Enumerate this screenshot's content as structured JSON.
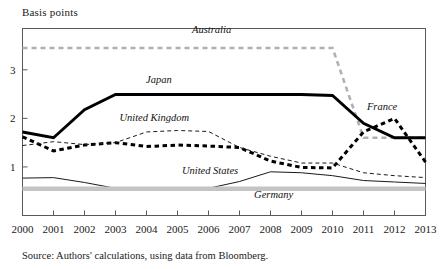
{
  "axis_title": "Basis points",
  "source_note": "Source: Authors' calculations, using data from Bloomberg.",
  "chart_data": {
    "type": "line",
    "title": "Basis points",
    "xlabel": "",
    "ylabel": "Basis points",
    "grid": false,
    "legend_position": "inline-labels",
    "xlim": [
      2000,
      2013
    ],
    "ylim": [
      0,
      3.85
    ],
    "yticks": [
      1,
      2,
      3
    ],
    "categories": [
      2000,
      2001,
      2002,
      2003,
      2004,
      2005,
      2006,
      2007,
      2008,
      2009,
      2010,
      2011,
      2012,
      2013
    ],
    "xtick_labels": [
      "2000",
      "2001",
      "2002",
      "2003",
      "2004",
      "2005",
      "2006",
      "2007",
      "2008",
      "2009",
      "2010",
      "2011",
      "2012",
      "2013"
    ],
    "series": [
      {
        "name": "Australia",
        "style": "dashed-gray",
        "color": "#b0b0b0",
        "width": 2.6,
        "dash": "5,4",
        "label_x": 2006.1,
        "label_y": 3.75,
        "values": [
          3.45,
          3.45,
          3.45,
          3.45,
          3.45,
          3.45,
          3.45,
          3.45,
          3.45,
          3.45,
          3.45,
          1.6,
          1.6,
          1.6
        ]
      },
      {
        "name": "Japan",
        "style": "solid-thick-black",
        "color": "#000000",
        "width": 2.9,
        "dash": "none",
        "label_x": 2004.4,
        "label_y": 2.72,
        "values": [
          1.72,
          1.6,
          2.18,
          2.49,
          2.49,
          2.49,
          2.49,
          2.49,
          2.49,
          2.49,
          2.47,
          1.9,
          1.6,
          1.6
        ]
      },
      {
        "name": "France",
        "style": "dashed-thick-black",
        "color": "#000000",
        "width": 3.0,
        "dash": "4.5,3.5",
        "label_x": 2011.6,
        "label_y": 2.17,
        "values": [
          1.62,
          1.33,
          1.45,
          1.5,
          1.42,
          1.45,
          1.43,
          1.4,
          1.12,
          0.99,
          0.98,
          1.72,
          2.0,
          1.1
        ]
      },
      {
        "name": "United Kingdom",
        "style": "dashed-thin-black",
        "color": "#1a1a1a",
        "width": 1.0,
        "dash": "4,3",
        "label_x": 2004.25,
        "label_y": 1.95,
        "values": [
          1.44,
          1.52,
          1.46,
          1.5,
          1.72,
          1.75,
          1.73,
          1.4,
          1.22,
          1.08,
          1.08,
          0.88,
          0.82,
          0.78
        ]
      },
      {
        "name": "United States",
        "style": "solid-thin-black",
        "color": "#1a1a1a",
        "width": 1.0,
        "dash": "none",
        "label_x": 2006.05,
        "label_y": 0.86,
        "values": [
          0.77,
          0.78,
          0.68,
          0.56,
          0.55,
          0.54,
          0.56,
          0.7,
          0.9,
          0.88,
          0.82,
          0.72,
          0.69,
          0.66
        ]
      },
      {
        "name": "Germany",
        "style": "solid-thick-gray",
        "color": "#c4c4c4",
        "width": 4.5,
        "dash": "none",
        "label_x": 2008.1,
        "label_y": 0.36,
        "values": [
          0.55,
          0.55,
          0.55,
          0.55,
          0.55,
          0.55,
          0.55,
          0.55,
          0.55,
          0.55,
          0.55,
          0.55,
          0.55,
          0.55
        ]
      }
    ]
  }
}
